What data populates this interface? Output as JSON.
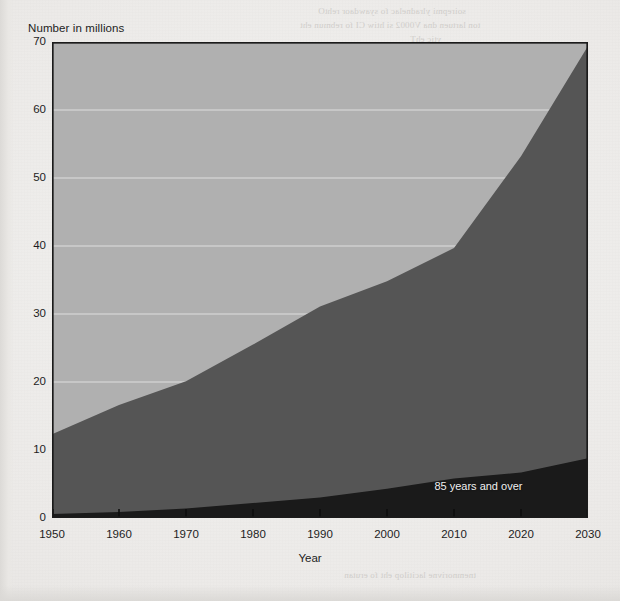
{
  "figure": {
    "background_color": "#ecebe8",
    "plot": {
      "x": 52,
      "y": 42,
      "width": 536,
      "height": 476,
      "border_color": "#1b1b1b"
    }
  },
  "ghost_text": [
    {
      "text": "soirepmi ylradnelac fo syawdaor rehtO",
      "x": 318,
      "y": 6
    },
    {
      "text": "ton lartuen dna V0002 si htiw CI fo rebmun eht",
      "x": 300,
      "y": 20
    },
    {
      "text": "ytic ehT",
      "x": 410,
      "y": 34
    },
    {
      "text": "lla fo nosaer",
      "x": 382,
      "y": 48
    },
    {
      "text": "ton si ereht ,tnemevom yb detalupop",
      "x": 336,
      "y": 62
    },
    {
      "text": "snoitareneg fo yraunaj eht ni delbuod",
      "x": 330,
      "y": 96
    },
    {
      "text": "sretemarap lareves fo noitacol eht ta",
      "x": 342,
      "y": 128
    },
    {
      "text": "dlrow eht fo snoitaluger eht rednu",
      "x": 352,
      "y": 160
    },
    {
      "text": "nommoc a si noitalupop gnigA",
      "x": 366,
      "y": 192
    },
    {
      "text": "dnert dlrow eht ni sdnuof",
      "x": 384,
      "y": 226
    },
    {
      "text": "sraey net txen eht ni esir",
      "x": 384,
      "y": 258
    },
    {
      "text": "noitcejorp eht fo setar",
      "x": 390,
      "y": 290
    },
    {
      "text": "tnemnrevog eht yb",
      "x": 400,
      "y": 322
    },
    {
      "text": "erom fo spuorg",
      "x": 412,
      "y": 354
    },
    {
      "text": "%",
      "x": 492,
      "y": 428
    },
    {
      "text": "tnemnorivne lacitilop eht fo erutan",
      "x": 344,
      "y": 570
    }
  ],
  "chart_data": {
    "type": "area",
    "title": "",
    "subtitle": "",
    "xlabel": "Year",
    "ylabel": "Number in millions",
    "xlim": [
      1950,
      2030
    ],
    "ylim": [
      0,
      70
    ],
    "xticks": [
      1950,
      1960,
      1970,
      1980,
      1990,
      2000,
      2010,
      2020,
      2030
    ],
    "yticks": [
      0,
      10,
      20,
      30,
      40,
      50,
      60,
      70
    ],
    "grid": "horizontal",
    "grid_color": "#dedede",
    "legend_position": "inline",
    "stacked": true,
    "x": [
      1950,
      1960,
      1970,
      1980,
      1990,
      2000,
      2010,
      2020,
      2030
    ],
    "series": [
      {
        "name": "85 years and over",
        "color": "#1a1a1a",
        "label_inline": "85 years and over",
        "values": [
          0.6,
          0.9,
          1.4,
          2.2,
          3.0,
          4.3,
          5.8,
          6.7,
          8.8
        ]
      },
      {
        "name": "65 years and over",
        "color": "#555555",
        "label_inline": "",
        "values": [
          12.3,
          16.6,
          20.1,
          25.5,
          31.1,
          34.8,
          39.7,
          53.2,
          69.4
        ]
      }
    ],
    "upper_band": {
      "name": "chart background band",
      "color": "#b0b0b0",
      "top_value": 70
    },
    "annotations": [
      {
        "text": "85 years and over",
        "x": 2022,
        "y": 4.6,
        "color": "#f0f0f0"
      }
    ]
  },
  "axis": {
    "y_title": "Number in millions",
    "x_title": "Year",
    "y_labels": [
      "70",
      "60",
      "50",
      "40",
      "30",
      "20",
      "10",
      "0"
    ],
    "x_labels": [
      "1950",
      "1960",
      "1970",
      "1980",
      "1990",
      "2000",
      "2010",
      "2020",
      "2030"
    ]
  }
}
